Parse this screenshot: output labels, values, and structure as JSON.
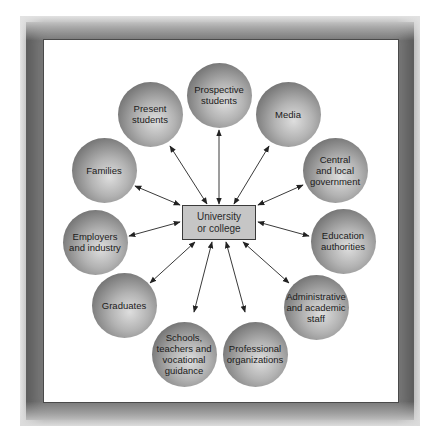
{
  "diagram": {
    "center": {
      "label": "University\nor college",
      "x": 219,
      "y": 222
    },
    "nodes": [
      {
        "id": "prospective-students",
        "label": "Prospective\nstudents",
        "cx": 219,
        "cy": 95
      },
      {
        "id": "present-students",
        "label": "Present\nstudents",
        "cx": 150,
        "cy": 114
      },
      {
        "id": "media",
        "label": "Media",
        "cx": 288,
        "cy": 114
      },
      {
        "id": "families",
        "label": "Families",
        "cx": 104,
        "cy": 170
      },
      {
        "id": "central-local-government",
        "label": "Central\nand local\ngovernment",
        "cx": 335,
        "cy": 170
      },
      {
        "id": "employers-industry",
        "label": "Employers\nand industry",
        "cx": 95,
        "cy": 242
      },
      {
        "id": "education-authorities",
        "label": "Education\nauthorities",
        "cx": 343,
        "cy": 241
      },
      {
        "id": "graduates",
        "label": "Graduates",
        "cx": 124,
        "cy": 305
      },
      {
        "id": "administrative-academic-staff",
        "label": "Administrative\nand academic\nstaff",
        "cx": 316,
        "cy": 307
      },
      {
        "id": "schools-teachers-guidance",
        "label": "Schools,\nteachers and\nvocational\nguidance",
        "cx": 184,
        "cy": 354
      },
      {
        "id": "professional-organizations",
        "label": "Professional\norganizations",
        "cx": 255,
        "cy": 354
      }
    ],
    "links": [
      {
        "to": "prospective-students",
        "x1": 219,
        "y1": 204,
        "x2": 219,
        "y2": 130,
        "type": "double-arrow"
      },
      {
        "to": "present-students",
        "x1": 207,
        "y1": 204,
        "x2": 170,
        "y2": 146,
        "type": "double-arrow"
      },
      {
        "to": "media",
        "x1": 234,
        "y1": 204,
        "x2": 269,
        "y2": 146,
        "type": "double-arrow"
      },
      {
        "to": "families",
        "x1": 180,
        "y1": 205,
        "x2": 135,
        "y2": 186,
        "type": "double-arrow"
      },
      {
        "to": "central-local-government",
        "x1": 258,
        "y1": 205,
        "x2": 303,
        "y2": 185,
        "type": "double-arrow"
      },
      {
        "to": "employers-industry",
        "x1": 180,
        "y1": 222,
        "x2": 129,
        "y2": 236,
        "type": "double-arrow"
      },
      {
        "to": "education-authorities",
        "x1": 258,
        "y1": 222,
        "x2": 309,
        "y2": 236,
        "type": "double-arrow"
      },
      {
        "to": "graduates",
        "x1": 195,
        "y1": 242,
        "x2": 150,
        "y2": 283,
        "type": "double-arrow"
      },
      {
        "to": "administrative-academic-staff",
        "x1": 243,
        "y1": 242,
        "x2": 289,
        "y2": 283,
        "type": "double-arrow"
      },
      {
        "to": "schools-teachers-guidance",
        "x1": 212,
        "y1": 242,
        "x2": 194,
        "y2": 312,
        "type": "double-arrow"
      },
      {
        "to": "professional-organizations",
        "x1": 226,
        "y1": 242,
        "x2": 245,
        "y2": 312,
        "type": "double-arrow"
      }
    ],
    "colors": {
      "frame": "#6e6e6e",
      "center_box_fill": "#c6c6c6",
      "node_highlight": "#dedede",
      "node_edge": "#4f4f4f",
      "arrow": "#333333"
    }
  }
}
